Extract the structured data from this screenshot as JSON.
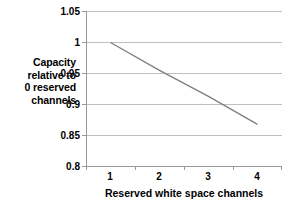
{
  "chart_data": {
    "type": "line",
    "title": "",
    "xlabel": "Reserved white space channels",
    "ylabel": "Capacity relative to 0 reserved channels",
    "ylabel_lines": [
      "Capacity",
      "relative to",
      "0 reserved",
      "channels"
    ],
    "categories": [
      "1",
      "2",
      "3",
      "4"
    ],
    "values": [
      1.0,
      0.955,
      0.913,
      0.868
    ],
    "series": [
      {
        "name": "Capacity relative to 0 reserved channels",
        "values": [
          1.0,
          0.955,
          0.913,
          0.868
        ],
        "color": "#808080"
      }
    ],
    "ylim": [
      0.8,
      1.05
    ],
    "yticks": [
      0.8,
      0.85,
      0.9,
      0.95,
      1.0,
      1.05
    ],
    "ytick_labels": [
      "0.8",
      "0.85",
      "0.9",
      "0.95",
      "1",
      "1.05"
    ],
    "xticks": [
      "1",
      "2",
      "3",
      "4"
    ],
    "grid": true,
    "grid_axis": "y",
    "grid_color": "#BFBFBF",
    "axis_color": "#9A9A9A",
    "legend": false,
    "legend_position": "none",
    "background": "#FFFFFF",
    "markers": false
  }
}
